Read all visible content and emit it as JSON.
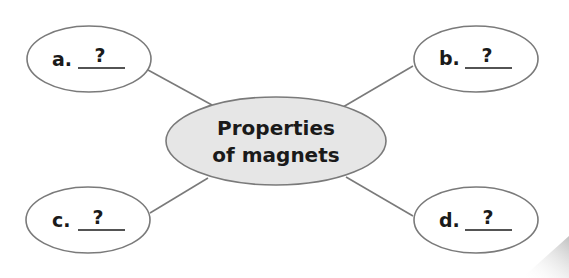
{
  "diagram": {
    "type": "concept-web",
    "colors": {
      "outline": "#7a7a7a",
      "center_fill": "#e6e6e6",
      "node_fill": "#ffffff",
      "text": "#1a1a1a",
      "page_shadow": "#c8c8c8"
    },
    "center": {
      "line1": "Properties",
      "line2": "of magnets"
    },
    "nodes": [
      {
        "id": "a",
        "label": "a.",
        "blank": "?"
      },
      {
        "id": "b",
        "label": "b.",
        "blank": "?"
      },
      {
        "id": "c",
        "label": "c.",
        "blank": "?"
      },
      {
        "id": "d",
        "label": "d.",
        "blank": "?"
      }
    ],
    "connections": [
      {
        "from": "center",
        "to": "a"
      },
      {
        "from": "center",
        "to": "b"
      },
      {
        "from": "center",
        "to": "c"
      },
      {
        "from": "center",
        "to": "d"
      }
    ]
  }
}
